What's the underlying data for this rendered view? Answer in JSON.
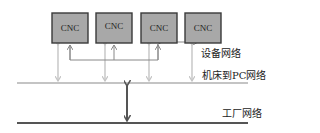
{
  "diagram": {
    "nodes": [
      {
        "id": "cnc-1",
        "label": "CNC"
      },
      {
        "id": "cnc-2",
        "label": "CNC"
      },
      {
        "id": "cnc-3",
        "label": "CNC"
      },
      {
        "id": "cnc-4",
        "label": "CNC"
      }
    ],
    "networks": {
      "device": "设备网络",
      "machine_to_pc": "机床到PC网络",
      "factory": "工厂网络"
    },
    "colors": {
      "box_fill": "#a8a8a8",
      "box_border": "#3a3a3a",
      "light_line": "#c4c4c4",
      "dark_line": "#555555",
      "device_line": "#777777"
    }
  }
}
